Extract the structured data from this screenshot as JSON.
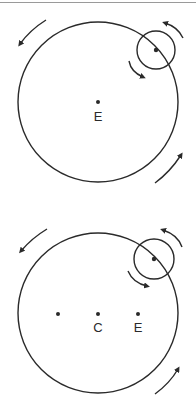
{
  "colors": {
    "stroke": "#2a2a2a",
    "background": "#ffffff",
    "top_rule": "#9a9a9a"
  },
  "diagram_top": {
    "description": "Epicycle on deferent centered on Earth",
    "deferent": {
      "cx": 98,
      "cy": 102,
      "r": 80
    },
    "epicycle": {
      "cx": 156,
      "cy": 50,
      "r": 19
    },
    "points": [
      {
        "x": 98,
        "y": 102,
        "label": "E"
      }
    ]
  },
  "diagram_bottom": {
    "description": "Epicycle on eccentric deferent with center C, Earth E, and equant point",
    "deferent": {
      "cx": 98,
      "cy": 313,
      "r": 80
    },
    "epicycle": {
      "cx": 154,
      "cy": 259,
      "r": 20
    },
    "points": [
      {
        "x": 58,
        "y": 314,
        "label": ""
      },
      {
        "x": 98,
        "y": 314,
        "label": "C"
      },
      {
        "x": 138,
        "y": 314,
        "label": "E"
      }
    ]
  },
  "labels": {
    "top_e": "E",
    "bottom_c": "C",
    "bottom_e": "E"
  }
}
